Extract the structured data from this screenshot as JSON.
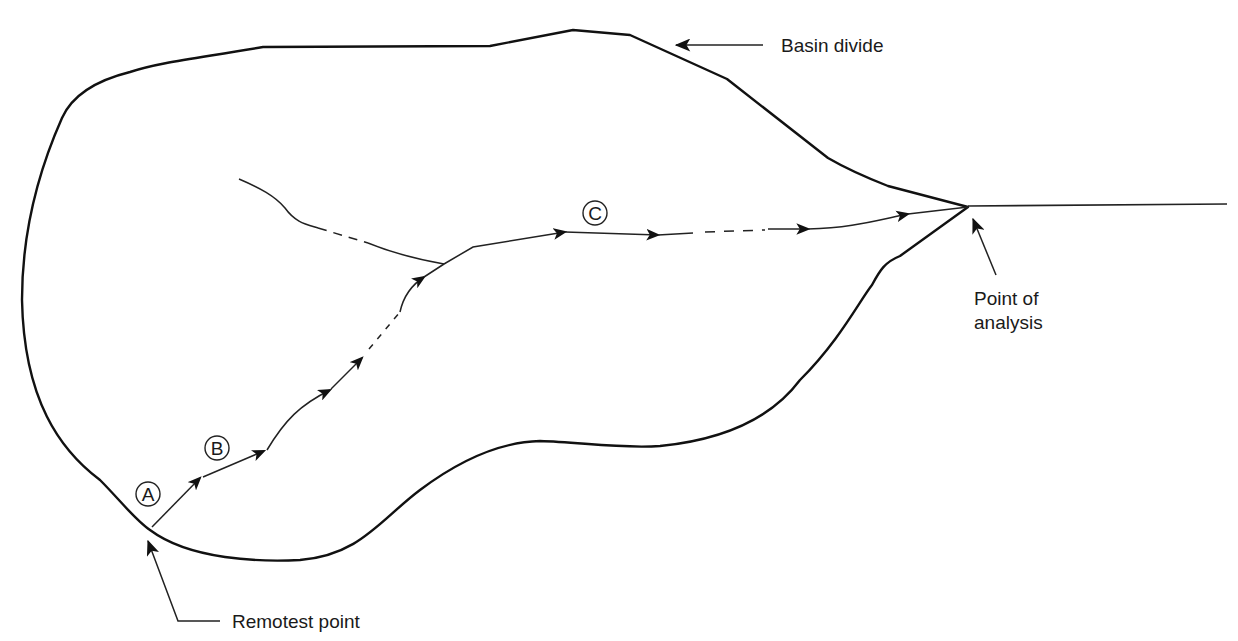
{
  "diagram": {
    "type": "watershed-flow-path",
    "colors": {
      "line": "#111111",
      "background": "#ffffff"
    },
    "labels": {
      "basin_divide": "Basin divide",
      "point_of_analysis_line1": "Point of",
      "point_of_analysis_line2": "analysis",
      "remotest_point": "Remotest point"
    },
    "segment_markers": {
      "a": "A",
      "b": "B",
      "c": "C"
    },
    "elements": [
      {
        "name": "basin-divide",
        "description": "Closed watershed boundary outline"
      },
      {
        "name": "main-flow-path",
        "description": "Flow path from remotest point to point of analysis, with arrowheads, segments A (sheet flow), B (shallow concentrated flow), C (channel flow)"
      },
      {
        "name": "tributary",
        "description": "Upstream tributary joining main channel, partly dashed"
      },
      {
        "name": "outlet-channel",
        "description": "Channel continuing beyond point of analysis"
      }
    ]
  }
}
